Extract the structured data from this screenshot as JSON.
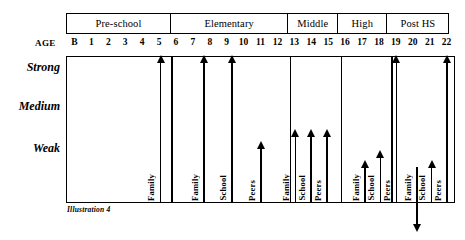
{
  "caption": "Illustration 4",
  "age_header_label": "AGE",
  "stages": [
    {
      "label": "Pre-school",
      "width_pct": 27.0
    },
    {
      "label": "Elementary",
      "width_pct": 30.6
    },
    {
      "label": "Middle",
      "width_pct": 13.1
    },
    {
      "label": "High",
      "width_pct": 13.1
    },
    {
      "label": "Post HS",
      "width_pct": 16.2
    }
  ],
  "age_ticks": [
    "B",
    "1",
    "2",
    "3",
    "4",
    "5",
    "6",
    "7",
    "8",
    "9",
    "10",
    "11",
    "12",
    "13",
    "14",
    "15",
    "16",
    "17",
    "18",
    "19",
    "20",
    "21",
    "22"
  ],
  "levels": [
    {
      "label": "Strong"
    },
    {
      "label": "Medium"
    },
    {
      "label": "Weak"
    }
  ],
  "influences": [
    "Family",
    "School",
    "Peers"
  ],
  "chart_data": {
    "type": "bar",
    "xlabel": "AGE",
    "ylabel": "",
    "categories": [
      "Pre-school",
      "Elementary",
      "Middle",
      "High",
      "Post HS"
    ],
    "ytick_labels": [
      "Strong",
      "Medium",
      "Weak"
    ],
    "ylim": [
      0,
      3
    ],
    "grid": false,
    "legend": "none",
    "note": "Vertical arrows rising from the baseline; arrow tip height encodes strength of influence. The Post HS Family arrow points downward below the axis (declining / negligible).",
    "series": [
      {
        "name": "Family",
        "values": [
          3.0,
          3.0,
          0.95,
          0.55,
          -0.2
        ],
        "directions": [
          "up",
          "up",
          "up",
          "up",
          "down"
        ],
        "present": [
          true,
          true,
          true,
          true,
          true
        ]
      },
      {
        "name": "School",
        "values": [
          null,
          3.0,
          0.95,
          0.75,
          0.75
        ],
        "directions": [
          null,
          "up",
          "up",
          "up",
          "up"
        ],
        "present": [
          false,
          true,
          true,
          true,
          true
        ]
      },
      {
        "name": "Peers",
        "values": [
          null,
          0.75,
          0.95,
          3.0,
          3.0
        ],
        "directions": [
          null,
          "up",
          "up",
          "up",
          "up"
        ],
        "present": [
          false,
          true,
          true,
          true,
          true
        ]
      }
    ]
  },
  "arrows": [
    {
      "stage": "Pre-school",
      "label": "Family",
      "left_pct": 24.0,
      "tip_top_px": 5,
      "base_px": 146,
      "dir": "up"
    },
    {
      "stage": "Elementary",
      "label": "Family",
      "left_pct": 35.2,
      "tip_top_px": 5,
      "base_px": 146,
      "dir": "up"
    },
    {
      "stage": "Elementary",
      "label": "School",
      "left_pct": 42.5,
      "tip_top_px": 5,
      "base_px": 146,
      "dir": "up"
    },
    {
      "stage": "Elementary",
      "label": "Peers",
      "left_pct": 49.9,
      "tip_top_px": 91,
      "base_px": 146,
      "dir": "up"
    },
    {
      "stage": "Middle",
      "label": "Family",
      "left_pct": 58.8,
      "tip_top_px": 79,
      "base_px": 146,
      "dir": "up"
    },
    {
      "stage": "Middle",
      "label": "School",
      "left_pct": 62.9,
      "tip_top_px": 79,
      "base_px": 146,
      "dir": "up"
    },
    {
      "stage": "Middle",
      "label": "Peers",
      "left_pct": 67.0,
      "tip_top_px": 79,
      "base_px": 146,
      "dir": "up"
    },
    {
      "stage": "High",
      "label": "Family",
      "left_pct": 76.8,
      "tip_top_px": 110,
      "base_px": 146,
      "dir": "up"
    },
    {
      "stage": "High",
      "label": "School",
      "left_pct": 80.8,
      "tip_top_px": 100,
      "base_px": 146,
      "dir": "up"
    },
    {
      "stage": "High",
      "label": "Peers",
      "left_pct": 84.9,
      "tip_top_px": 5,
      "base_px": 146,
      "dir": "up"
    },
    {
      "stage": "Post HS",
      "label": "Family",
      "left_pct": 90.2,
      "tip_top_px": 110,
      "base_px": 146,
      "dir": "down"
    },
    {
      "stage": "Post HS",
      "label": "School",
      "left_pct": 94.0,
      "tip_top_px": 110,
      "base_px": 146,
      "dir": "up"
    },
    {
      "stage": "Post HS",
      "label": "Peers",
      "left_pct": 98.0,
      "tip_top_px": 5,
      "base_px": 146,
      "dir": "up"
    }
  ]
}
